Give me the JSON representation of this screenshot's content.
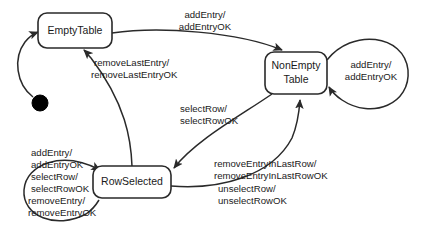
{
  "diagram": {
    "kind": "uml-state-machine",
    "stroke_color": "#2a2a2a",
    "text_color": "#1a1a1a",
    "background_color": "#ffffff",
    "initial_node_color": "#000000"
  },
  "states": [
    {
      "id": "empty-table",
      "label": "EmptyTable",
      "x": 38,
      "y": 13,
      "w": 74,
      "h": 35
    },
    {
      "id": "non-empty-table",
      "label_line1": "NonEmpty",
      "label_line2": "Table",
      "x": 265,
      "y": 52,
      "w": 62,
      "h": 42
    },
    {
      "id": "row-selected",
      "label": "RowSelected",
      "x": 93,
      "y": 166,
      "w": 78,
      "h": 32
    }
  ],
  "initial": {
    "name": "initial-pseudostate",
    "cx": 40,
    "cy": 103,
    "r": 8,
    "target": "empty-table"
  },
  "transitions": [
    {
      "id": "empty-to-nonempty",
      "from": "EmptyTable",
      "to": "NonEmptyTable",
      "lines": [
        "addEntry/",
        "addEntryOK"
      ],
      "label_x": 205,
      "label_y": 18
    },
    {
      "id": "nonempty-self-loop",
      "from": "NonEmptyTable",
      "to": "NonEmptyTable",
      "lines": [
        "addEntry/",
        "addEntryOK"
      ],
      "label_x": 371,
      "label_y": 68
    },
    {
      "id": "rowselected-to-empty",
      "from": "RowSelected",
      "to": "EmptyTable",
      "lines": [
        "removeLastEntry/",
        "removeLastEntryOK"
      ],
      "label_x": 94,
      "label_y": 62
    },
    {
      "id": "nonempty-to-rowselected",
      "from": "NonEmptyTable",
      "to": "RowSelected",
      "lines": [
        "selectRow/",
        "selectRowOK"
      ],
      "label_x": 180,
      "label_y": 108
    },
    {
      "id": "rowselected-to-nonempty",
      "from": "RowSelected",
      "to": "NonEmptyTable",
      "lines": [
        "removeEntryInLastRow/",
        "removeEntryInLastRowOK",
        "unselectRow/",
        "unselectRowOK"
      ],
      "label_x": 216,
      "label_y": 163
    },
    {
      "id": "rowselected-self-loop",
      "from": "RowSelected",
      "to": "RowSelected",
      "lines": [
        "addEntry/",
        "addEntryOK",
        "selectRow/",
        "selectRowOK",
        "removeEntry/",
        "removeEntryOK"
      ],
      "label_x": 31,
      "label_y": 152
    }
  ]
}
